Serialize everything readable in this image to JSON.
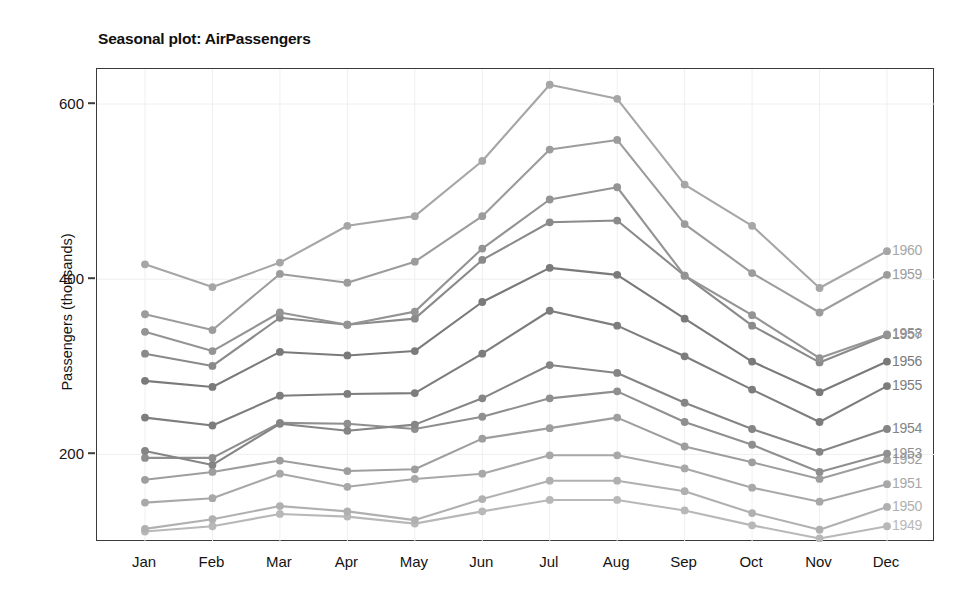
{
  "chart_data": {
    "type": "line",
    "title": "Seasonal plot: AirPassengers",
    "xlabel": "",
    "ylabel": "Passengers (thousands)",
    "categories": [
      "Jan",
      "Feb",
      "Mar",
      "Apr",
      "May",
      "Jun",
      "Jul",
      "Aug",
      "Sep",
      "Oct",
      "Nov",
      "Dec"
    ],
    "ylim": [
      100,
      640
    ],
    "yticks": [
      200,
      400,
      600
    ],
    "ytick_labels": [
      "200",
      "400",
      "600"
    ],
    "grid": true,
    "legend_position": "right-edge-series-labels",
    "series": [
      {
        "name": "1949",
        "label": "1949",
        "color": "#b8b8b8",
        "values": [
          112,
          118,
          132,
          129,
          121,
          135,
          148,
          148,
          136,
          119,
          104,
          118
        ]
      },
      {
        "name": "1950",
        "label": "1950",
        "color": "#b0b0b0",
        "values": [
          115,
          126,
          141,
          135,
          125,
          149,
          170,
          170,
          158,
          133,
          114,
          140
        ]
      },
      {
        "name": "1951",
        "label": "1951",
        "color": "#a8a8a8",
        "values": [
          145,
          150,
          178,
          163,
          172,
          178,
          199,
          199,
          184,
          162,
          146,
          166
        ]
      },
      {
        "name": "1952",
        "label": "1952",
        "color": "#9e9e9e",
        "values": [
          171,
          180,
          193,
          181,
          183,
          218,
          230,
          242,
          209,
          191,
          172,
          194
        ]
      },
      {
        "name": "1953",
        "label": "1953",
        "color": "#8f8f8f",
        "values": [
          196,
          196,
          236,
          235,
          229,
          243,
          264,
          272,
          237,
          211,
          180,
          201
        ]
      },
      {
        "name": "1954",
        "label": "1954",
        "color": "#858585",
        "values": [
          204,
          188,
          235,
          227,
          234,
          264,
          302,
          293,
          259,
          229,
          203,
          229
        ]
      },
      {
        "name": "1955",
        "label": "1955",
        "color": "#7d7d7d",
        "values": [
          242,
          233,
          267,
          269,
          270,
          315,
          364,
          347,
          312,
          274,
          237,
          278
        ]
      },
      {
        "name": "1956",
        "label": "1956",
        "color": "#7a7a7a",
        "values": [
          284,
          277,
          317,
          313,
          318,
          374,
          413,
          405,
          355,
          306,
          271,
          306
        ]
      },
      {
        "name": "1957",
        "label": "1957",
        "color": "#8a8a8a",
        "values": [
          315,
          301,
          356,
          348,
          355,
          422,
          465,
          467,
          404,
          347,
          305,
          336
        ]
      },
      {
        "name": "1958",
        "label": "1958",
        "color": "#949494",
        "values": [
          340,
          318,
          362,
          348,
          363,
          435,
          491,
          505,
          404,
          359,
          310,
          337
        ]
      },
      {
        "name": "1959",
        "label": "1959",
        "color": "#9c9c9c",
        "values": [
          360,
          342,
          406,
          396,
          420,
          472,
          548,
          559,
          463,
          407,
          362,
          405
        ]
      },
      {
        "name": "1960",
        "label": "1960",
        "color": "#a6a6a6",
        "values": [
          417,
          391,
          419,
          461,
          472,
          535,
          622,
          606,
          508,
          461,
          390,
          432
        ]
      }
    ]
  },
  "axes": {
    "y_title": "Passengers (thousands)"
  },
  "colors": {
    "panel_border": "#3a3a3a",
    "gridline": "#efefef",
    "text": "#141414",
    "background": "#ffffff"
  }
}
